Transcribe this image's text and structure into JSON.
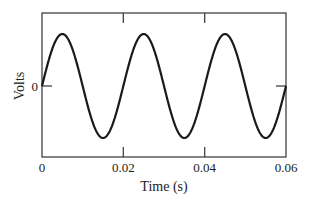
{
  "chart_data": {
    "type": "line",
    "title": "",
    "xlabel": "Time (s)",
    "ylabel": "Volts",
    "xlim": [
      0,
      0.06
    ],
    "ylim": [
      -1.15,
      1.15
    ],
    "x_ticks": [
      0,
      0.02,
      0.04,
      0.06
    ],
    "x_tick_labels": [
      "0",
      "0.02",
      "0.04",
      "0.06"
    ],
    "y_ticks": [
      0
    ],
    "y_tick_labels": [
      "0"
    ],
    "grid": false,
    "legend": null,
    "series": [
      {
        "name": "voltage",
        "function": "sin(2*pi*50*t)",
        "frequency_hz": 50,
        "amplitude": 1,
        "x": [
          0,
          0.005,
          0.01,
          0.015,
          0.02,
          0.025,
          0.03,
          0.035,
          0.04,
          0.045,
          0.05,
          0.055,
          0.06
        ],
        "values": [
          0,
          1,
          0,
          -1,
          0,
          1,
          0,
          -1,
          0,
          1,
          0,
          -1,
          0
        ]
      }
    ]
  },
  "labels": {
    "xlabel": "Time (s)",
    "ylabel": "Volts",
    "x0": "0",
    "x1": "0.02",
    "x2": "0.04",
    "x3": "0.06",
    "y0": "0"
  },
  "colors": {
    "line": "#1a1a1a",
    "frame": "#333333"
  }
}
